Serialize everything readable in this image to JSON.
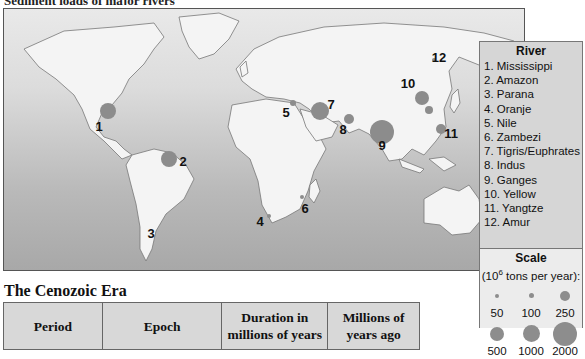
{
  "figure": {
    "title_cropped": "Sediment loads of major rivers"
  },
  "map": {
    "markers": [
      {
        "id": 1,
        "label": "1",
        "river": "Mississippi",
        "cx": 104,
        "cy": 102,
        "r": 8,
        "lx": 95,
        "ly": 117
      },
      {
        "id": 2,
        "label": "2",
        "river": "Amazon",
        "cx": 165,
        "cy": 150,
        "r": 8,
        "lx": 179,
        "ly": 152
      },
      {
        "id": 3,
        "label": "3",
        "river": "Parana",
        "cx": 0,
        "cy": 0,
        "r": 0,
        "lx": 147,
        "ly": 224
      },
      {
        "id": 4,
        "label": "4",
        "river": "Oranje",
        "cx": 265,
        "cy": 207,
        "r": 2,
        "lx": 256,
        "ly": 212
      },
      {
        "id": 5,
        "label": "5",
        "river": "Nile",
        "cx": 289,
        "cy": 94,
        "r": 3,
        "lx": 282,
        "ly": 103
      },
      {
        "id": 6,
        "label": "6",
        "river": "Zambezi",
        "cx": 298,
        "cy": 188,
        "r": 2,
        "lx": 301,
        "ly": 199
      },
      {
        "id": 7,
        "label": "7",
        "river": "Tigris/Euphrates",
        "cx": 316,
        "cy": 102,
        "r": 9,
        "lx": 327,
        "ly": 95
      },
      {
        "id": 8,
        "label": "8",
        "river": "Indus",
        "cx": 345,
        "cy": 110,
        "r": 5,
        "lx": 339,
        "ly": 120
      },
      {
        "id": 9,
        "label": "9",
        "river": "Ganges",
        "cx": 378,
        "cy": 123,
        "r": 12,
        "lx": 378,
        "ly": 136
      },
      {
        "id": 10,
        "label": "10",
        "river": "Yellow",
        "cx": 418,
        "cy": 89,
        "r": 7,
        "lx": 404,
        "ly": 74
      },
      {
        "id": 11,
        "label": "11",
        "river": "Yangtze",
        "cx": 437,
        "cy": 120,
        "r": 5,
        "lx": 447,
        "ly": 124
      },
      {
        "id": 12,
        "label": "12",
        "river": "Amur",
        "cx": 430,
        "cy": 51,
        "r": 2,
        "lx": 435,
        "ly": 48
      },
      {
        "id": 0,
        "label": "",
        "river": "",
        "cx": 425,
        "cy": 101,
        "r": 4,
        "lx": 0,
        "ly": 0
      }
    ],
    "marker_color": "#8c8c8c"
  },
  "legend": {
    "river_heading": "River",
    "rivers": [
      "1. Mississippi",
      "2. Amazon",
      "3. Parana",
      "4. Oranje",
      "5. Nile",
      "6. Zambezi",
      "7. Tigris/Euphrates",
      "8. Indus",
      "9. Ganges",
      "10. Yellow",
      "11. Yangtze",
      "12. Amur"
    ],
    "scale_heading": "Scale",
    "scale_unit_prefix": "(10",
    "scale_unit_exp": "6",
    "scale_unit_suffix": " tons per year):",
    "scale_values": [
      {
        "value": "50",
        "size": 4
      },
      {
        "value": "100",
        "size": 5
      },
      {
        "value": "250",
        "size": 10
      },
      {
        "value": "500",
        "size": 14
      },
      {
        "value": "1000",
        "size": 17
      },
      {
        "value": "2000",
        "size": 24
      }
    ]
  },
  "era": {
    "title": "The Cenozoic Era",
    "headers": [
      "Period",
      "Epoch",
      "Duration in millions of years",
      "Millions of years ago"
    ],
    "header_lines": [
      [
        "Period"
      ],
      [
        "Epoch"
      ],
      [
        "Duration in",
        "millions of years"
      ],
      [
        "Millions of",
        "years ago"
      ]
    ]
  }
}
